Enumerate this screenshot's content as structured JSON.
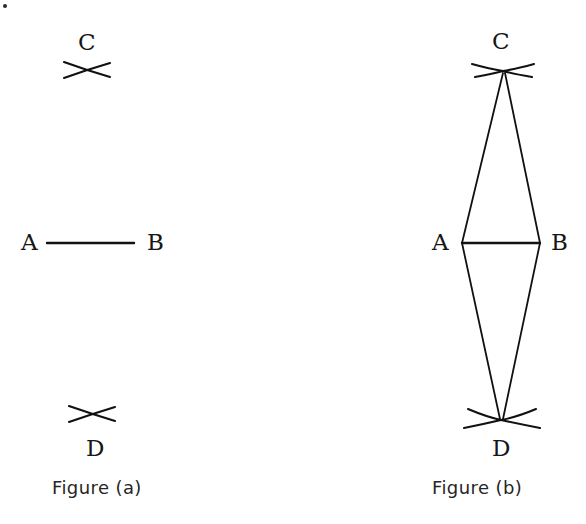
{
  "page": {
    "background_color": "#ffffff",
    "ink_color": "#111111",
    "width": 586,
    "height": 524,
    "artifact_speck": "scan-speck"
  },
  "figures": [
    {
      "id": "figure-a",
      "caption": "Figure (a)",
      "caption_pos": {
        "x": 52,
        "y": 479
      },
      "description": "Line segment AB with arc intersection marks above at C and below at D",
      "labels": [
        {
          "name": "label-c",
          "text": "C",
          "x": 78,
          "y": 31
        },
        {
          "name": "label-a",
          "text": "A",
          "x": 21,
          "y": 231
        },
        {
          "name": "label-b",
          "text": "B",
          "x": 147,
          "y": 231
        },
        {
          "name": "label-d",
          "text": "D",
          "x": 86,
          "y": 437
        }
      ],
      "segment": {
        "name": "segment-ab",
        "x1": 47,
        "y1": 243,
        "x2": 134,
        "y2": 243
      },
      "arc_marks": [
        {
          "name": "arc-cross-c",
          "cx": 87,
          "cy": 70
        },
        {
          "name": "arc-cross-d",
          "cx": 92,
          "cy": 414
        }
      ]
    },
    {
      "id": "figure-b",
      "caption": "Figure (b)",
      "caption_pos": {
        "x": 432,
        "y": 479
      },
      "description": "Rhombus ACBD formed by joining C and D to endpoints A and B of segment AB",
      "labels": [
        {
          "name": "label-c",
          "text": "C",
          "x": 492,
          "y": 30
        },
        {
          "name": "label-a",
          "text": "A",
          "x": 432,
          "y": 231
        },
        {
          "name": "label-b",
          "text": "B",
          "x": 551,
          "y": 231
        },
        {
          "name": "label-d",
          "text": "D",
          "x": 492,
          "y": 437
        }
      ],
      "vertices": {
        "C": {
          "x": 503,
          "y": 71
        },
        "A": {
          "x": 462,
          "y": 243
        },
        "B": {
          "x": 540,
          "y": 243
        },
        "D": {
          "x": 501,
          "y": 420
        }
      },
      "segment": {
        "name": "segment-ab",
        "x1": 462,
        "y1": 243,
        "x2": 540,
        "y2": 243
      },
      "construction_lines": [
        {
          "name": "line-ca",
          "from": "C",
          "to": "A"
        },
        {
          "name": "line-cb",
          "from": "C",
          "to": "B"
        },
        {
          "name": "line-ad",
          "from": "A",
          "to": "D"
        },
        {
          "name": "line-bd",
          "from": "B",
          "to": "D"
        }
      ],
      "arc_marks": [
        {
          "name": "arc-cross-c",
          "cx": 503,
          "cy": 71
        },
        {
          "name": "arc-cross-d",
          "cx": 501,
          "cy": 420
        }
      ]
    }
  ]
}
